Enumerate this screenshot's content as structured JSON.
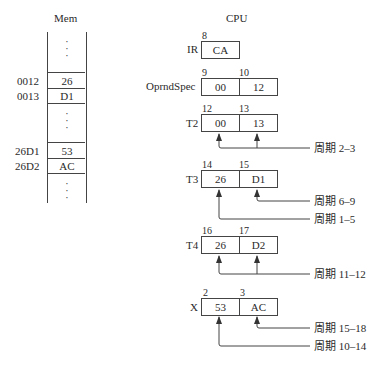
{
  "mem": {
    "title": "Mem",
    "rows": [
      {
        "addr": "0012",
        "value": "26"
      },
      {
        "addr": "0013",
        "value": "D1"
      },
      {
        "addr": "26D1",
        "value": "53"
      },
      {
        "addr": "26D2",
        "value": "AC"
      }
    ],
    "ellipsis": ":"
  },
  "cpu": {
    "title": "CPU",
    "registers": [
      {
        "name": "IR",
        "cells": [
          {
            "num": "8",
            "value": "CA"
          }
        ]
      },
      {
        "name": "OprndSpec",
        "cells": [
          {
            "num": "9",
            "value": "00"
          },
          {
            "num": "10",
            "value": "12"
          }
        ]
      },
      {
        "name": "T2",
        "cells": [
          {
            "num": "12",
            "value": "00"
          },
          {
            "num": "13",
            "value": "13"
          }
        ]
      },
      {
        "name": "T3",
        "cells": [
          {
            "num": "14",
            "value": "26"
          },
          {
            "num": "15",
            "value": "D1"
          }
        ]
      },
      {
        "name": "T4",
        "cells": [
          {
            "num": "16",
            "value": "26"
          },
          {
            "num": "17",
            "value": "D2"
          }
        ]
      },
      {
        "name": "X",
        "cells": [
          {
            "num": "2",
            "value": "53"
          },
          {
            "num": "3",
            "value": "AC"
          }
        ]
      }
    ]
  },
  "annotations": [
    {
      "target": "T2",
      "label": "周期 2–3"
    },
    {
      "target": "T3.low",
      "label": "周期 6–9"
    },
    {
      "target": "T3.high",
      "label": "周期 1–5"
    },
    {
      "target": "T4",
      "label": "周期 11–12"
    },
    {
      "target": "X.low",
      "label": "周期 15–18"
    },
    {
      "target": "X.high",
      "label": "周期 10–14"
    }
  ]
}
